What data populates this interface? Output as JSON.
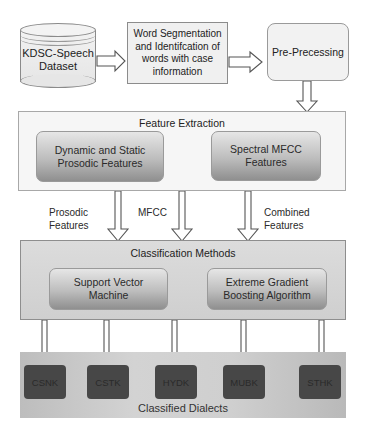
{
  "diagram": {
    "nodes": {
      "dataset": {
        "label_line1": "KDSC-Speech",
        "label_line2": "Dataset",
        "shape": "cylinder-icon"
      },
      "segmentation": {
        "lines": [
          "Word Segmentation",
          "and Identifcation of",
          "words with case",
          "information"
        ]
      },
      "preprocessing": {
        "label": "Pre-Precessing"
      },
      "feature_extraction": {
        "title": "Feature Extraction",
        "children": [
          {
            "lines": [
              "Dynamic and Static",
              "Prosodic Features"
            ]
          },
          {
            "lines": [
              "Spectral MFCC",
              "Features"
            ]
          }
        ]
      },
      "classification": {
        "title": "Classification  Methods",
        "children": [
          {
            "lines": [
              "Support Vector",
              "Machine"
            ]
          },
          {
            "lines": [
              "Extreme Gradient",
              "Boosting Algorithm"
            ]
          }
        ]
      },
      "classified": {
        "title": "Classified Dialects",
        "dialects": [
          "CSNK",
          "CSTK",
          "HYDK",
          "MUBK",
          "STHK"
        ]
      }
    },
    "edge_labels": {
      "prosodic": {
        "line1": "Prosodic",
        "line2": "Features"
      },
      "mfcc": {
        "line1": "MFCC"
      },
      "combined": {
        "line1": "Combined",
        "line2": "Features"
      }
    },
    "colors": {
      "box_light": "#f0f0f0",
      "border": "#8c8c8c",
      "inner_gradient_top": "#e6e6e6",
      "inner_gradient_bottom": "#8f8f8f",
      "dialect_box": "#474747",
      "arrow_fill": "#ffffff",
      "arrow_stroke": "#555555"
    }
  }
}
